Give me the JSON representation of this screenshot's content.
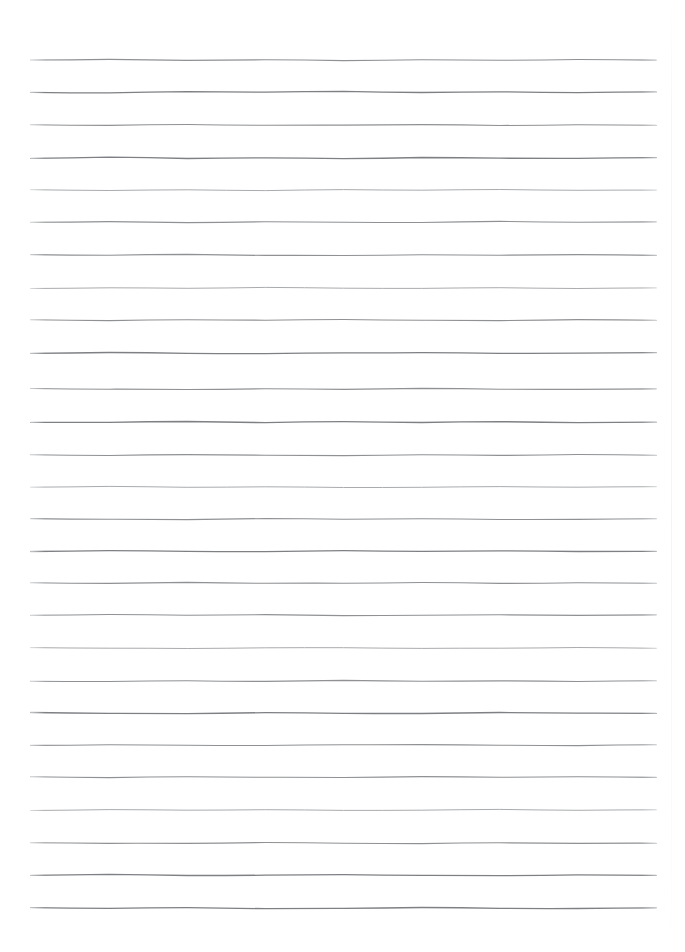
{
  "document": {
    "kind": "scanned-lined-paper",
    "title": "Blank ruled notebook page",
    "content_text": "",
    "background_color": "#ffffff",
    "rule_color": "#8f9194",
    "page_width": 685,
    "page_height": 952
  },
  "ruling": {
    "line_count": 27,
    "first_line_y": 60,
    "last_line_y": 908,
    "line_spacing": 32.6,
    "left_margin_x": 31,
    "right_margin_x": 656,
    "line_length": 625,
    "stroke_width": 1.15,
    "style": "hand-drawn horizontal rules",
    "has_vertical_margin_rule": false,
    "has_holes": false,
    "has_text": false
  },
  "lines": [
    {
      "index": 1,
      "y": 60,
      "ink": "normal",
      "wobble": [
        0.0,
        -0.6,
        0.4,
        -0.3,
        0.6,
        -0.2,
        0.3,
        -0.5,
        0.1
      ]
    },
    {
      "index": 2,
      "y": 92,
      "ink": "dark",
      "wobble": [
        0.3,
        0.9,
        -0.4,
        0.2,
        -0.7,
        0.5,
        -0.2,
        0.6,
        -0.1
      ]
    },
    {
      "index": 3,
      "y": 125,
      "ink": "normal",
      "wobble": [
        -0.2,
        0.4,
        -0.5,
        0.3,
        0.1,
        -0.4,
        0.5,
        -0.2,
        0.3
      ]
    },
    {
      "index": 4,
      "y": 158,
      "ink": "dark",
      "wobble": [
        0.4,
        -0.8,
        0.5,
        -0.2,
        0.7,
        -0.5,
        0.2,
        0.4,
        -0.3
      ]
    },
    {
      "index": 5,
      "y": 190,
      "ink": "light",
      "wobble": [
        -0.3,
        0.5,
        -0.2,
        0.6,
        -0.4,
        0.2,
        -0.5,
        0.3,
        0.1
      ]
    },
    {
      "index": 6,
      "y": 222,
      "ink": "normal",
      "wobble": [
        0.2,
        -0.4,
        0.6,
        -0.3,
        0.2,
        0.5,
        -0.6,
        0.2,
        -0.2
      ]
    },
    {
      "index": 7,
      "y": 255,
      "ink": "normal",
      "wobble": [
        -0.4,
        0.3,
        -0.6,
        0.4,
        0.5,
        -0.3,
        0.2,
        -0.4,
        0.4
      ]
    },
    {
      "index": 8,
      "y": 288,
      "ink": "light",
      "wobble": [
        0.5,
        -0.2,
        0.3,
        -0.6,
        0.2,
        0.4,
        -0.3,
        0.5,
        -0.1
      ]
    },
    {
      "index": 9,
      "y": 320,
      "ink": "normal",
      "wobble": [
        -0.2,
        0.6,
        -0.3,
        0.2,
        -0.5,
        0.3,
        0.6,
        -0.4,
        0.2
      ]
    },
    {
      "index": 10,
      "y": 353,
      "ink": "dark",
      "wobble": [
        0.3,
        -0.5,
        0.4,
        0.6,
        -0.2,
        -0.4,
        0.3,
        0.2,
        -0.3
      ]
    },
    {
      "index": 11,
      "y": 389,
      "ink": "normal",
      "wobble": [
        -0.5,
        0.2,
        0.5,
        -0.3,
        0.4,
        -0.6,
        0.2,
        0.3,
        -0.2
      ]
    },
    {
      "index": 12,
      "y": 422,
      "ink": "dark",
      "wobble": [
        0.4,
        0.3,
        -0.5,
        0.6,
        -0.3,
        0.5,
        -0.4,
        0.6,
        0.2
      ]
    },
    {
      "index": 13,
      "y": 455,
      "ink": "normal",
      "wobble": [
        -0.3,
        0.5,
        -0.4,
        0.2,
        0.6,
        -0.2,
        0.4,
        -0.5,
        0.3
      ]
    },
    {
      "index": 14,
      "y": 487,
      "ink": "light",
      "wobble": [
        0.2,
        -0.6,
        0.3,
        -0.2,
        0.5,
        0.3,
        -0.4,
        0.2,
        -0.3
      ]
    },
    {
      "index": 15,
      "y": 519,
      "ink": "normal",
      "wobble": [
        -0.4,
        0.3,
        0.6,
        -0.5,
        0.2,
        -0.3,
        0.5,
        0.4,
        -0.2
      ]
    },
    {
      "index": 16,
      "y": 551,
      "ink": "dark",
      "wobble": [
        0.5,
        -0.3,
        0.4,
        0.6,
        -0.4,
        0.3,
        -0.2,
        0.5,
        0.3
      ]
    },
    {
      "index": 17,
      "y": 583,
      "ink": "normal",
      "wobble": [
        -0.2,
        0.4,
        -0.6,
        0.3,
        0.2,
        -0.5,
        0.4,
        -0.3,
        0.2
      ]
    },
    {
      "index": 18,
      "y": 615,
      "ink": "normal",
      "wobble": [
        0.3,
        -0.5,
        0.2,
        -0.4,
        0.6,
        0.2,
        -0.3,
        0.4,
        -0.2
      ]
    },
    {
      "index": 19,
      "y": 648,
      "ink": "light",
      "wobble": [
        -0.4,
        0.2,
        0.5,
        -0.2,
        -0.3,
        0.4,
        0.2,
        -0.5,
        0.3
      ]
    },
    {
      "index": 20,
      "y": 681,
      "ink": "normal",
      "wobble": [
        0.2,
        0.5,
        -0.3,
        0.4,
        -0.6,
        0.3,
        -0.2,
        0.5,
        -0.3
      ]
    },
    {
      "index": 21,
      "y": 713,
      "ink": "dark",
      "wobble": [
        -0.5,
        0.3,
        0.6,
        -0.4,
        0.3,
        0.5,
        -0.5,
        0.2,
        0.4
      ]
    },
    {
      "index": 22,
      "y": 745,
      "ink": "normal",
      "wobble": [
        0.4,
        -0.2,
        0.3,
        0.5,
        -0.3,
        -0.4,
        0.2,
        0.6,
        -0.2
      ]
    },
    {
      "index": 23,
      "y": 777,
      "ink": "normal",
      "wobble": [
        -0.3,
        0.6,
        -0.2,
        0.3,
        0.5,
        -0.4,
        0.3,
        -0.2,
        0.4
      ]
    },
    {
      "index": 24,
      "y": 810,
      "ink": "light",
      "wobble": [
        0.5,
        -0.4,
        0.2,
        -0.3,
        0.4,
        0.2,
        -0.6,
        0.3,
        -0.2
      ]
    },
    {
      "index": 25,
      "y": 843,
      "ink": "normal",
      "wobble": [
        -0.2,
        0.3,
        0.4,
        -0.5,
        0.2,
        0.6,
        -0.3,
        0.4,
        0.2
      ]
    },
    {
      "index": 26,
      "y": 875,
      "ink": "dark",
      "wobble": [
        0.3,
        -0.6,
        0.5,
        0.2,
        -0.4,
        0.3,
        0.6,
        -0.2,
        0.3
      ]
    },
    {
      "index": 27,
      "y": 908,
      "ink": "dark",
      "wobble": [
        -0.4,
        0.4,
        -0.3,
        0.6,
        0.3,
        -0.5,
        0.4,
        0.5,
        -0.2
      ]
    }
  ]
}
